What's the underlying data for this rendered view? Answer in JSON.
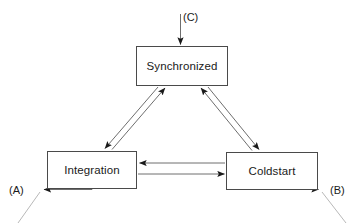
{
  "diagram": {
    "type": "state-diagram",
    "background_color": "#ffffff",
    "line_color": "#6e6e6e",
    "box_border_color": "#4a4a4a",
    "arrowhead_color": "#1a1a1a",
    "text_color": "#1a1a1a",
    "nodes": [
      {
        "id": "synchronized",
        "label": "Synchronized",
        "x": 136,
        "y": 46,
        "width": 92,
        "height": 40
      },
      {
        "id": "integration",
        "label": "Integration",
        "x": 47,
        "y": 151,
        "width": 90,
        "height": 38
      },
      {
        "id": "coldstart",
        "label": "Coldstart",
        "x": 226,
        "y": 152,
        "width": 92,
        "height": 38
      }
    ],
    "port_labels": [
      {
        "id": "a",
        "label": "(A)",
        "x": 9,
        "y": 184
      },
      {
        "id": "b",
        "label": "(B)",
        "x": 330,
        "y": 184
      },
      {
        "id": "c",
        "label": "(C)",
        "x": 183,
        "y": 11
      }
    ],
    "edges": [
      {
        "id": "c-to-synchronized",
        "from": "(C)",
        "to": "Synchronized",
        "direction": "down"
      },
      {
        "id": "integration-to-synchronized",
        "from": "Integration",
        "to": "Synchronized",
        "direction": "up-right"
      },
      {
        "id": "synchronized-to-integration",
        "from": "Synchronized",
        "to": "Integration",
        "direction": "down-left"
      },
      {
        "id": "coldstart-to-synchronized",
        "from": "Coldstart",
        "to": "Synchronized",
        "direction": "up-left"
      },
      {
        "id": "synchronized-to-coldstart",
        "from": "Synchronized",
        "to": "Coldstart",
        "direction": "down-right"
      },
      {
        "id": "coldstart-to-integration",
        "from": "Coldstart",
        "to": "Integration",
        "direction": "left"
      },
      {
        "id": "integration-to-coldstart",
        "from": "Integration",
        "to": "Coldstart",
        "direction": "right"
      },
      {
        "id": "integration-to-a",
        "from": "Integration",
        "to": "(A)",
        "direction": "left"
      },
      {
        "id": "coldstart-to-b",
        "from": "Coldstart",
        "to": "(B)",
        "direction": "right"
      }
    ]
  }
}
